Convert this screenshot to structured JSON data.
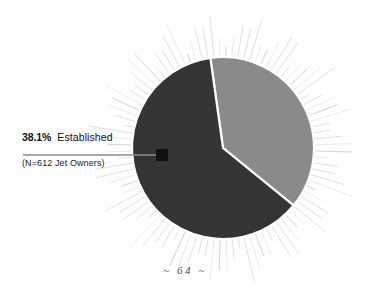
{
  "page": {
    "background_color": "#fefefe",
    "page_number_label": "~ 64 ~"
  },
  "callout": {
    "percent": "38.1%",
    "segment_name": "Established",
    "sample_size": "(N=612 Jet Owners)",
    "marker_color": "#111111",
    "leader_line_color": "#8c8c8c"
  },
  "chart_data": {
    "type": "pie",
    "title": "",
    "subtitle": "",
    "xlabel": "",
    "ylabel": "",
    "legend_position": "callout-left",
    "grid": false,
    "annotations": [
      "38.1%  Established",
      "(N=612 Jet Owners)",
      "~ 64 ~"
    ],
    "labels": [
      "Established",
      "Other"
    ],
    "values": [
      38.1,
      61.9
    ],
    "value_suffix": "%",
    "colors": [
      "#8a8a8a",
      "#343434"
    ],
    "sample_size": 612,
    "sample_unit": "Jet Owners",
    "slices": [
      {
        "label": "Established",
        "value": 38.1,
        "color": "#8a8a8a",
        "labeled": true,
        "label_text": "38.1%  Established"
      },
      {
        "label": "Other",
        "value": 61.9,
        "color": "#343434",
        "labeled": false,
        "label_text": ""
      }
    ],
    "decoration": {
      "style": "sunburst-rays",
      "ray_count": 96,
      "ray_color": "#b9b9b9"
    }
  },
  "pie_geometry": {
    "center_x": 223,
    "center_y": 148,
    "radius": 91,
    "start_angle_deg": -8,
    "established_sweep_deg": 137.2
  }
}
